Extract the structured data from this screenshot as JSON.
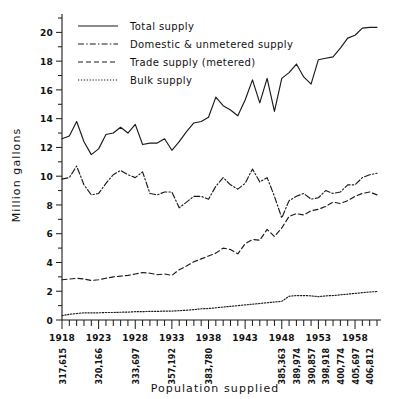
{
  "chart_data": {
    "type": "line",
    "title": "",
    "xlabel": "Population supplied",
    "ylabel": "Million gallons",
    "ylim": [
      0,
      21
    ],
    "xlim": [
      1918,
      1961
    ],
    "grid": false,
    "legend_position": "top-left",
    "y_ticks_major": [
      0,
      2,
      4,
      6,
      8,
      10,
      12,
      14,
      16,
      18,
      20
    ],
    "y_ticks_minor": [
      1,
      3,
      5,
      7,
      9,
      11,
      13,
      15,
      17,
      19,
      21
    ],
    "x_ticks_major": [
      1918,
      1923,
      1928,
      1933,
      1938,
      1943,
      1948,
      1953,
      1958
    ],
    "x_tick_labels": [
      "1918",
      "1923",
      "1928",
      "1933",
      "1938",
      "1943",
      "1948",
      "1953",
      "1958"
    ],
    "x": [
      1918,
      1919,
      1920,
      1921,
      1922,
      1923,
      1924,
      1925,
      1926,
      1927,
      1928,
      1929,
      1930,
      1931,
      1932,
      1933,
      1934,
      1935,
      1936,
      1937,
      1938,
      1939,
      1940,
      1941,
      1942,
      1943,
      1944,
      1945,
      1946,
      1947,
      1948,
      1949,
      1950,
      1951,
      1952,
      1953,
      1954,
      1955,
      1956,
      1957,
      1958,
      1959,
      1960,
      1961
    ],
    "population_labels": [
      {
        "year": 1918,
        "value": "317,615"
      },
      {
        "year": 1923,
        "value": "320,166"
      },
      {
        "year": 1928,
        "value": "333,697"
      },
      {
        "year": 1933,
        "value": "357,192"
      },
      {
        "year": 1938,
        "value": "383,780"
      },
      {
        "year": 1948,
        "value": "385,363"
      },
      {
        "year": 1950,
        "value": "389,974"
      },
      {
        "year": 1952,
        "value": "390,857"
      },
      {
        "year": 1954,
        "value": "398,918"
      },
      {
        "year": 1956,
        "value": "400,774"
      },
      {
        "year": 1958,
        "value": "405,697"
      },
      {
        "year": 1960,
        "value": "406,812"
      }
    ],
    "series": [
      {
        "name": "Total supply",
        "key": "total",
        "dash": "none",
        "values": [
          12.6,
          12.8,
          13.8,
          12.4,
          11.5,
          11.9,
          12.9,
          13.0,
          13.4,
          13.0,
          13.6,
          12.2,
          12.3,
          12.3,
          12.6,
          11.8,
          12.4,
          13.1,
          13.7,
          13.8,
          14.1,
          15.5,
          14.9,
          14.6,
          14.2,
          15.3,
          16.7,
          15.1,
          16.8,
          14.5,
          16.8,
          17.2,
          17.8,
          16.9,
          16.4,
          18.1,
          18.2,
          18.3,
          18.9,
          19.6,
          19.8,
          20.3,
          20.35,
          20.35
        ]
      },
      {
        "name": "Domestic & unmetered supply",
        "key": "domestic",
        "dash": "dashdot",
        "values": [
          9.8,
          9.9,
          10.7,
          9.4,
          8.7,
          8.8,
          9.5,
          10.1,
          10.4,
          10.1,
          9.9,
          10.3,
          8.8,
          8.7,
          8.9,
          8.9,
          7.8,
          8.2,
          8.6,
          8.6,
          8.4,
          9.3,
          9.9,
          9.4,
          9.1,
          9.5,
          10.5,
          9.6,
          9.9,
          8.6,
          7.1,
          8.3,
          8.6,
          8.8,
          8.4,
          8.5,
          9.0,
          8.8,
          8.9,
          9.4,
          9.4,
          9.9,
          10.1,
          10.2
        ]
      },
      {
        "name": "Trade supply (metered)",
        "key": "trade",
        "dash": "dash",
        "values": [
          2.8,
          2.85,
          2.9,
          2.85,
          2.75,
          2.8,
          2.9,
          3.0,
          3.05,
          3.1,
          3.2,
          3.3,
          3.25,
          3.15,
          3.2,
          3.1,
          3.5,
          3.75,
          4.05,
          4.25,
          4.45,
          4.65,
          5.0,
          4.9,
          4.6,
          5.3,
          5.6,
          5.55,
          6.3,
          5.8,
          6.4,
          7.2,
          7.4,
          7.3,
          7.6,
          7.7,
          7.9,
          8.2,
          8.1,
          8.3,
          8.6,
          8.8,
          8.9,
          8.7
        ]
      },
      {
        "name": "Bulk supply",
        "key": "bulk",
        "dash": "dot",
        "values": [
          0.3,
          0.4,
          0.45,
          0.5,
          0.5,
          0.5,
          0.52,
          0.52,
          0.54,
          0.55,
          0.58,
          0.58,
          0.6,
          0.6,
          0.62,
          0.62,
          0.65,
          0.68,
          0.72,
          0.78,
          0.8,
          0.85,
          0.9,
          0.95,
          1.0,
          1.05,
          1.1,
          1.15,
          1.2,
          1.25,
          1.3,
          1.65,
          1.7,
          1.7,
          1.68,
          1.62,
          1.68,
          1.7,
          1.75,
          1.8,
          1.85,
          1.9,
          1.95,
          1.98
        ]
      }
    ]
  },
  "legend": {
    "items": [
      {
        "label": "Total supply"
      },
      {
        "label": "Domestic & unmetered supply"
      },
      {
        "label": "Trade supply (metered)"
      },
      {
        "label": "Bulk supply"
      }
    ]
  },
  "axes": {
    "y_title": "Million gallons",
    "x_title": "Population supplied"
  }
}
